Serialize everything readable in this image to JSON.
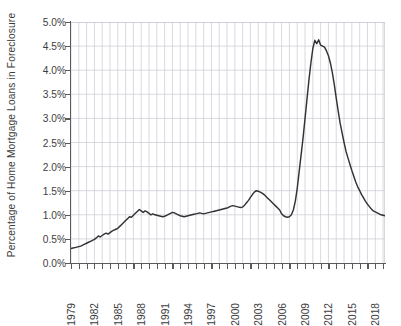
{
  "chart_data": {
    "type": "line",
    "title": "",
    "xlabel": "",
    "ylabel": "Percentage of Home Mortgage Loans in Foreclosure",
    "ylim": [
      0.0,
      5.0
    ],
    "xlim": [
      1979,
      2019.25
    ],
    "grid": true,
    "legend": null,
    "line_color": "#333333",
    "grid_color": "#c8c8d2",
    "axis_color": "#5a5a5a",
    "y_ticks": [
      "0.0%",
      "0.5%",
      "1.0%",
      "1.5%",
      "2.0%",
      "2.5%",
      "3.0%",
      "3.5%",
      "4.0%",
      "4.5%",
      "5.0%"
    ],
    "y_tick_values": [
      0.0,
      0.5,
      1.0,
      1.5,
      2.0,
      2.5,
      3.0,
      3.5,
      4.0,
      4.5,
      5.0
    ],
    "x_ticks": [
      "1979",
      "1982",
      "1985",
      "1988",
      "1991",
      "1994",
      "1997",
      "2000",
      "2003",
      "2006",
      "2009",
      "2012",
      "2015",
      "2018"
    ],
    "x_tick_values": [
      1979,
      1982,
      1985,
      1988,
      1991,
      1994,
      1997,
      2000,
      2003,
      2006,
      2009,
      2012,
      2015,
      2018
    ],
    "x_minor_step": 1,
    "series": [
      {
        "name": "Percentage of Home Mortgage Loans in Foreclosure",
        "x": [
          1979.0,
          1979.25,
          1979.5,
          1979.75,
          1980.0,
          1980.25,
          1980.5,
          1980.75,
          1981.0,
          1981.25,
          1981.5,
          1981.75,
          1982.0,
          1982.25,
          1982.5,
          1982.75,
          1983.0,
          1983.25,
          1983.5,
          1983.75,
          1984.0,
          1984.25,
          1984.5,
          1984.75,
          1985.0,
          1985.25,
          1985.5,
          1985.75,
          1986.0,
          1986.25,
          1986.5,
          1986.75,
          1987.0,
          1987.25,
          1987.5,
          1987.75,
          1988.0,
          1988.25,
          1988.5,
          1988.75,
          1989.0,
          1989.25,
          1989.5,
          1989.75,
          1990.0,
          1990.25,
          1990.5,
          1990.75,
          1991.0,
          1991.25,
          1991.5,
          1991.75,
          1992.0,
          1992.25,
          1992.5,
          1992.75,
          1993.0,
          1993.25,
          1993.5,
          1993.75,
          1994.0,
          1994.25,
          1994.5,
          1994.75,
          1995.0,
          1995.25,
          1995.5,
          1995.75,
          1996.0,
          1996.25,
          1996.5,
          1996.75,
          1997.0,
          1997.25,
          1997.5,
          1997.75,
          1998.0,
          1998.25,
          1998.5,
          1998.75,
          1999.0,
          1999.25,
          1999.5,
          1999.75,
          2000.0,
          2000.25,
          2000.5,
          2000.75,
          2001.0,
          2001.25,
          2001.5,
          2001.75,
          2002.0,
          2002.25,
          2002.5,
          2002.75,
          2003.0,
          2003.25,
          2003.5,
          2003.75,
          2004.0,
          2004.25,
          2004.5,
          2004.75,
          2005.0,
          2005.25,
          2005.5,
          2005.75,
          2006.0,
          2006.25,
          2006.5,
          2006.75,
          2007.0,
          2007.25,
          2007.5,
          2007.75,
          2008.0,
          2008.25,
          2008.5,
          2008.75,
          2009.0,
          2009.25,
          2009.5,
          2009.75,
          2010.0,
          2010.25,
          2010.5,
          2010.75,
          2011.0,
          2011.25,
          2011.5,
          2011.75,
          2012.0,
          2012.25,
          2012.5,
          2012.75,
          2013.0,
          2013.25,
          2013.5,
          2013.75,
          2014.0,
          2014.25,
          2014.5,
          2014.75,
          2015.0,
          2015.25,
          2015.5,
          2015.75,
          2016.0,
          2016.25,
          2016.5,
          2016.75,
          2017.0,
          2017.25,
          2017.5,
          2017.75,
          2018.0,
          2018.25,
          2018.5,
          2018.75,
          2019.0,
          2019.25
        ],
        "y": [
          0.3,
          0.31,
          0.32,
          0.33,
          0.34,
          0.35,
          0.37,
          0.39,
          0.41,
          0.43,
          0.45,
          0.47,
          0.49,
          0.52,
          0.56,
          0.54,
          0.57,
          0.6,
          0.62,
          0.6,
          0.63,
          0.66,
          0.68,
          0.7,
          0.72,
          0.76,
          0.8,
          0.84,
          0.88,
          0.92,
          0.96,
          0.95,
          0.99,
          1.03,
          1.07,
          1.11,
          1.08,
          1.05,
          1.08,
          1.06,
          1.03,
          1.0,
          1.02,
          1.0,
          0.99,
          0.98,
          0.97,
          0.96,
          0.97,
          0.99,
          1.01,
          1.03,
          1.05,
          1.04,
          1.02,
          1.0,
          0.98,
          0.97,
          0.96,
          0.97,
          0.98,
          0.99,
          1.0,
          1.01,
          1.02,
          1.03,
          1.04,
          1.03,
          1.02,
          1.03,
          1.04,
          1.05,
          1.06,
          1.07,
          1.08,
          1.09,
          1.1,
          1.11,
          1.12,
          1.13,
          1.14,
          1.16,
          1.18,
          1.19,
          1.18,
          1.17,
          1.16,
          1.15,
          1.16,
          1.2,
          1.25,
          1.3,
          1.36,
          1.42,
          1.47,
          1.5,
          1.49,
          1.47,
          1.45,
          1.42,
          1.38,
          1.34,
          1.3,
          1.26,
          1.22,
          1.18,
          1.14,
          1.1,
          1.02,
          0.98,
          0.96,
          0.95,
          0.96,
          1.0,
          1.1,
          1.28,
          1.55,
          1.9,
          2.25,
          2.6,
          3.0,
          3.4,
          3.8,
          4.15,
          4.45,
          4.62,
          4.55,
          4.63,
          4.52,
          4.5,
          4.48,
          4.4,
          4.3,
          4.15,
          3.95,
          3.7,
          3.42,
          3.15,
          2.9,
          2.7,
          2.5,
          2.32,
          2.18,
          2.05,
          1.92,
          1.8,
          1.68,
          1.58,
          1.5,
          1.42,
          1.35,
          1.28,
          1.22,
          1.17,
          1.12,
          1.08,
          1.06,
          1.04,
          1.02,
          1.0,
          0.99,
          0.98
        ]
      }
    ]
  }
}
